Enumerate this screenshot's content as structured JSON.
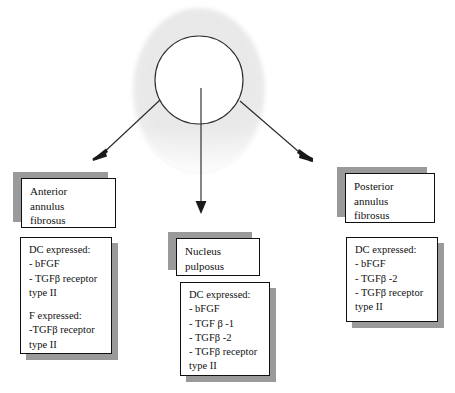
{
  "figure": {
    "type": "anatomical-schematic",
    "disc": {
      "annulus_label": "annulus fibrosus ring",
      "nucleus_label": "nucleus pulposus core"
    }
  },
  "regions": [
    {
      "id": "anterior",
      "title_lines": [
        "Anterior",
        "annulus",
        "fibrosus"
      ],
      "expression_lines": [
        "DC expressed:",
        "- bFGF",
        "- TGFβ receptor",
        "type II",
        "",
        "F expressed:",
        "-TGFβ receptor",
        "type II"
      ]
    },
    {
      "id": "nucleus",
      "title_lines": [
        "Nucleus",
        "pulposus"
      ],
      "expression_lines": [
        "DC expressed:",
        "- bFGF",
        "- TGF β -1",
        "- TGFβ -2",
        "- TGFβ receptor",
        "type II"
      ]
    },
    {
      "id": "posterior",
      "title_lines": [
        "Posterior",
        "annulus",
        "fibrosus"
      ],
      "expression_lines": [
        "DC expressed:",
        "- bFGF",
        "- TGFβ -2",
        "- TGFβ receptor",
        "type II"
      ]
    }
  ],
  "arrows": [
    {
      "id": "arrow-anterior",
      "from": "disc",
      "to": "anterior"
    },
    {
      "id": "arrow-nucleus",
      "from": "disc",
      "to": "nucleus"
    },
    {
      "id": "arrow-posterior",
      "from": "disc",
      "to": "posterior"
    }
  ],
  "colors": {
    "annulus_fill": "#e9e9e9",
    "nucleus_fill": "#ffffff",
    "outline": "#2b2b2b",
    "box_border": "#101010",
    "box_shadow": "#9a9a9a",
    "text": "#111111",
    "background": "#ffffff"
  }
}
